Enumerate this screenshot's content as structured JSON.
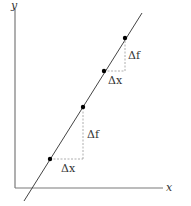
{
  "diagram": {
    "title": "",
    "axes": {
      "x_label": "x",
      "y_label": "y"
    },
    "line": {
      "description": "straight line with constant slope",
      "points": [
        {
          "x": 50,
          "y": 159
        },
        {
          "x": 83,
          "y": 107
        },
        {
          "x": 104,
          "y": 71
        },
        {
          "x": 125,
          "y": 38
        }
      ]
    },
    "triangles": [
      {
        "dx_label": "Δx",
        "df_label": "Δf"
      },
      {
        "dx_label": "Δx",
        "df_label": "Δf"
      }
    ],
    "colors": {
      "line": "#444444",
      "axes": "#777777",
      "dashed": "#999999",
      "points": "#000000",
      "text": "#333333"
    }
  }
}
